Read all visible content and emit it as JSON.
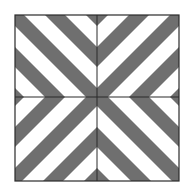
{
  "figure": {
    "quadrants": [
      {
        "name": "top-left",
        "stripe_direction": "\\"
      },
      {
        "name": "top-right",
        "stripe_direction": "/"
      },
      {
        "name": "bottom-left",
        "stripe_direction": "/"
      },
      {
        "name": "bottom-right",
        "stripe_direction": "\\"
      }
    ],
    "colors": {
      "stripe": "#6f6f6f",
      "background": "#ffffff",
      "border": "#2a2a2a",
      "divider": "#2a2a2a"
    }
  }
}
